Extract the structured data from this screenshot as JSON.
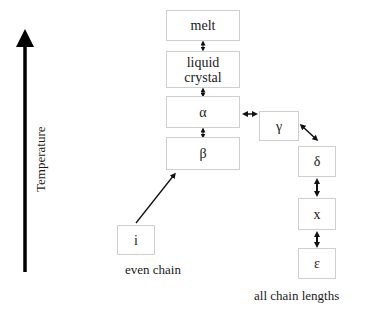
{
  "axis": {
    "label": "Temperature",
    "direction": "up"
  },
  "phases": {
    "melt": "melt",
    "liquid_crystal": "liquid\ncrystal",
    "alpha": "α",
    "beta": "β",
    "gamma": "γ",
    "delta": "δ",
    "x": "x",
    "epsilon": "ε",
    "i": "i"
  },
  "captions": {
    "even_chain": "even chain",
    "all_chain_lengths": "all chain lengths"
  },
  "connections": [
    {
      "from": "melt",
      "to": "liquid_crystal",
      "type": "bidirectional"
    },
    {
      "from": "liquid_crystal",
      "to": "alpha",
      "type": "bidirectional"
    },
    {
      "from": "alpha",
      "to": "beta",
      "type": "bidirectional"
    },
    {
      "from": "alpha",
      "to": "gamma",
      "type": "bidirectional"
    },
    {
      "from": "gamma",
      "to": "delta",
      "type": "bidirectional"
    },
    {
      "from": "delta",
      "to": "x",
      "type": "bidirectional"
    },
    {
      "from": "x",
      "to": "epsilon",
      "type": "bidirectional"
    },
    {
      "from": "i",
      "to": "beta",
      "type": "unidirectional"
    }
  ],
  "colors": {
    "line": "#111111",
    "box_border": "#cfcfcf",
    "text": "#1a1a1a"
  }
}
